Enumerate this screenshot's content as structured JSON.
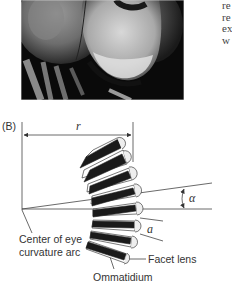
{
  "figure": {
    "photo": {
      "subject": "Close-up of dragonfly compound eyes and face",
      "alt": "dragonfly-head-photo"
    },
    "side_text_fragments": [
      "re",
      "re",
      "ex",
      "w"
    ],
    "panel_label": "(B)",
    "labels": {
      "radius": "r",
      "angle": "α",
      "facet_diameter": "a",
      "center_line1": "Center of eye",
      "center_line2": "curvature arc",
      "facet_lens": "Facet lens",
      "ommatidium": "Ommatidium"
    },
    "ommatidia_count": 8
  }
}
